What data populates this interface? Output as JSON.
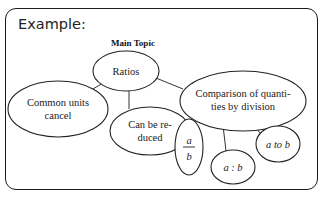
{
  "header": {
    "label": "Example:"
  },
  "diagram": {
    "title": "Main Topic",
    "root": {
      "label": "Ratios"
    },
    "nodes": {
      "common_units": {
        "line1": "Common units",
        "line2": "cancel"
      },
      "reduced": {
        "line1": "Can be re-",
        "line2": "duced"
      },
      "comparison": {
        "line1": "Comparison of quanti-",
        "line2": "ties by division"
      },
      "fraction": {
        "numerator": "a",
        "denominator": "b"
      },
      "colon": {
        "label": "a : b"
      },
      "to": {
        "label": "a to b"
      }
    }
  }
}
